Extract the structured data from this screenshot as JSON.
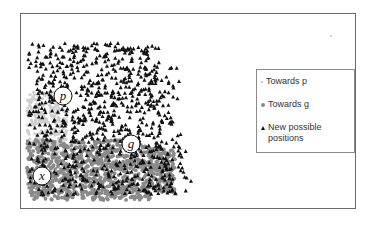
{
  "figure": {
    "markers": [
      {
        "id": "p",
        "label": "p",
        "cx": 63,
        "cy": 96,
        "r": 9
      },
      {
        "id": "g",
        "label": "g",
        "cx": 131,
        "cy": 144,
        "r": 9
      },
      {
        "id": "x",
        "label": "x",
        "cx": 42,
        "cy": 176,
        "r": 9
      }
    ],
    "colors": {
      "towards_p": "#cfcfcf",
      "towards_g": "#8a8a8a",
      "new_positions": "#111111",
      "frame": "#6a6a6a"
    }
  },
  "legend": {
    "items": [
      {
        "label": "Towards p",
        "symbol": "light-dot"
      },
      {
        "label": "Towards g",
        "symbol": "gray-dot"
      },
      {
        "label": "New possible positions",
        "symbol": "black-triangle"
      }
    ]
  }
}
